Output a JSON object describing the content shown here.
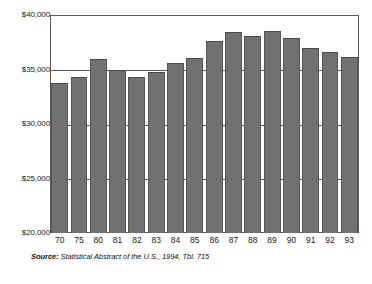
{
  "chart_data": {
    "type": "bar",
    "title": "",
    "subtitle": "",
    "xlabel": "",
    "ylabel": "",
    "categories": [
      "70",
      "75",
      "80",
      "81",
      "82",
      "83",
      "84",
      "85",
      "86",
      "87",
      "88",
      "89",
      "90",
      "91",
      "92",
      "93"
    ],
    "values": [
      33750,
      34350,
      36000,
      35000,
      34350,
      34750,
      35600,
      36050,
      37650,
      38400,
      38100,
      38550,
      37850,
      36950,
      36600,
      36150
    ],
    "ylim": [
      20000,
      40000
    ],
    "ytick_values": [
      20000,
      25000,
      30000,
      35000,
      40000
    ],
    "ytick_labels": [
      "$20,000",
      "$25,000",
      "$30,000",
      "$35,000",
      "$40,000"
    ],
    "grid": true,
    "legend": null,
    "legend_position": "none",
    "bar_color": "#717171",
    "axis_color": "#5a5a5a",
    "background_color": "#ffffff"
  },
  "source_note": {
    "label": "Source:",
    "text": "Statistical Abstract of the U.S., 1994, Tbl. 715"
  }
}
